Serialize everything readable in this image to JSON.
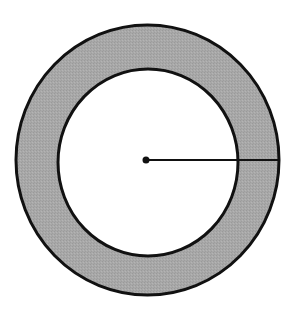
{
  "diagram": {
    "type": "annulus",
    "colors": {
      "background": "#ffffff",
      "ring_fill": "#a8a8a8",
      "stroke": "#111111"
    },
    "outer_circle": {
      "cx": 147.5,
      "cy": 160,
      "rx": 131.5,
      "ry": 135
    },
    "inner_circle": {
      "cx": 148,
      "cy": 162.5,
      "rx": 90,
      "ry": 93.5
    },
    "center_point": {
      "x": 146,
      "y": 160
    },
    "radius_line": {
      "x1": 146,
      "y1": 160,
      "x2": 279,
      "y2": 160
    },
    "labels": []
  }
}
